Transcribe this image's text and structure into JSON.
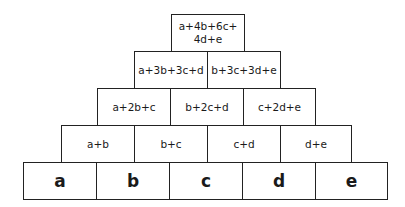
{
  "diagram": {
    "type": "number-pyramid",
    "rows": [
      {
        "level": 5,
        "cells": [
          "a+4b+6c+\n4d+e"
        ]
      },
      {
        "level": 4,
        "cells": [
          "a+3b+3c+d",
          "b+3c+3d+e"
        ]
      },
      {
        "level": 3,
        "cells": [
          "a+2b+c",
          "b+2c+d",
          "c+2d+e"
        ]
      },
      {
        "level": 2,
        "cells": [
          "a+b",
          "b+c",
          "c+d",
          "d+e"
        ]
      },
      {
        "level": 1,
        "cells": [
          "a",
          "b",
          "c",
          "d",
          "e"
        ]
      }
    ],
    "top_line1": "a+4b+6c+",
    "top_line2": "4d+e"
  },
  "colors": {
    "border": "#222222",
    "text": "#1a1a1a",
    "background": "#ffffff"
  }
}
